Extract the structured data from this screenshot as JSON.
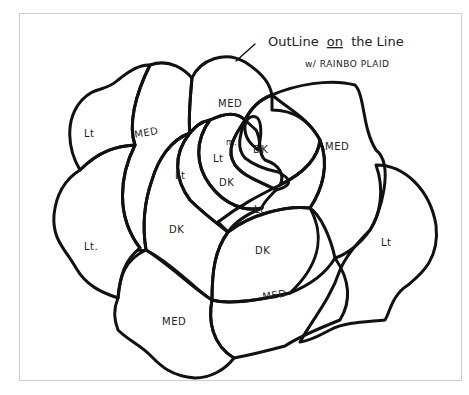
{
  "annotation": {
    "line1_prefix": "OutLine",
    "line1_on": "on",
    "line1_suffix": "the Line",
    "line2": "w/ RAINBO PLAID"
  },
  "labels": {
    "outer_left_top": "Lt",
    "outer_left_bottom": "Lt.",
    "left_med": "MED",
    "top_med": "MED",
    "right_med": "MED",
    "right_lt": "Lt",
    "bottom_left_med": "MED",
    "bottom_right_med": "MED",
    "center_dk_left": "DK",
    "center_dk_right": "DK",
    "center_lt_lower": "Lt",
    "inner_lt_left": "Lt",
    "inner_lt_mid": "Lt",
    "inner_dk_mid": "DK",
    "inner_dk_right": "DK",
    "inner_m": "m."
  },
  "colors": {
    "line": "#111111",
    "frame": "#cfcfcf",
    "background": "#ffffff"
  }
}
